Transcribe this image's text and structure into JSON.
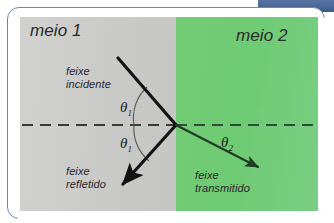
{
  "slide": {
    "background_color": "#ffffff",
    "accent_band_color": "#4a6695",
    "frame_border_color": "#6c86b4"
  },
  "figure": {
    "type": "optics-refraction-reflection-diagram",
    "media": {
      "left": {
        "label": "meio 1",
        "fill_color": "#cacac8"
      },
      "right": {
        "label": "meio 2",
        "fill_color": "#72cd75"
      }
    },
    "interface_line": {
      "name": "normal-dashed-line",
      "style": "dashed",
      "color": "#2f4a38"
    },
    "beams": [
      {
        "id": "incident",
        "label_line1": "feixe",
        "label_line2": "incidente",
        "color": "#111111",
        "arrow": false
      },
      {
        "id": "reflected",
        "label_line1": "feixe",
        "label_line2": "refletido",
        "color": "#111111",
        "arrow": true
      },
      {
        "id": "transmitted",
        "label_line1": "feixe",
        "label_line2": "transmitido",
        "color": "#1c3a24",
        "arrow": true
      }
    ],
    "angles": [
      {
        "id": "theta1-incident",
        "symbol": "θ",
        "subscript": "1"
      },
      {
        "id": "theta1-reflected",
        "symbol": "θ",
        "subscript": "1"
      },
      {
        "id": "theta2-refracted",
        "symbol": "θ",
        "subscript": "2"
      }
    ]
  }
}
